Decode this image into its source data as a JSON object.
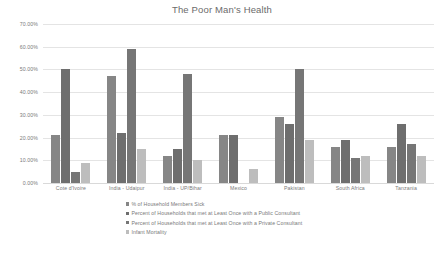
{
  "chart_data": {
    "type": "bar",
    "title": "The Poor Man's Health",
    "xlabel": "",
    "ylabel": "",
    "ylim": [
      0,
      70
    ],
    "grid": true,
    "legend_position": "bottom",
    "y_ticks": [
      "0.00%",
      "10.00%",
      "20.00%",
      "30.00%",
      "40.00%",
      "50.00%",
      "60.00%",
      "70.00%"
    ],
    "y_tick_values": [
      0,
      10,
      20,
      30,
      40,
      50,
      60,
      70
    ],
    "categories": [
      "Cote d'Ivoire",
      "India - Udaipur",
      "India - UP/Bihar",
      "Mexico",
      "Pakistan",
      "South Africa",
      "Tanzania"
    ],
    "series": [
      {
        "name": "% of Household Members Sick",
        "color": "#868686",
        "values": [
          21,
          47,
          12,
          21,
          29,
          16,
          16
        ]
      },
      {
        "name": "Percent of Households that met at Least Once with a Public Consultant",
        "color": "#6e6e6e",
        "values": [
          50,
          22,
          15,
          21,
          26,
          19,
          26
        ]
      },
      {
        "name": "Percent of Households that met at Least Once with a Private Consultant",
        "color": "#767676",
        "values": [
          5,
          59,
          48,
          0,
          50,
          11,
          17
        ]
      },
      {
        "name": "Infant Mortality",
        "color": "#bdbdbd",
        "values": [
          9,
          15,
          10,
          6,
          19,
          12,
          12
        ]
      }
    ]
  }
}
